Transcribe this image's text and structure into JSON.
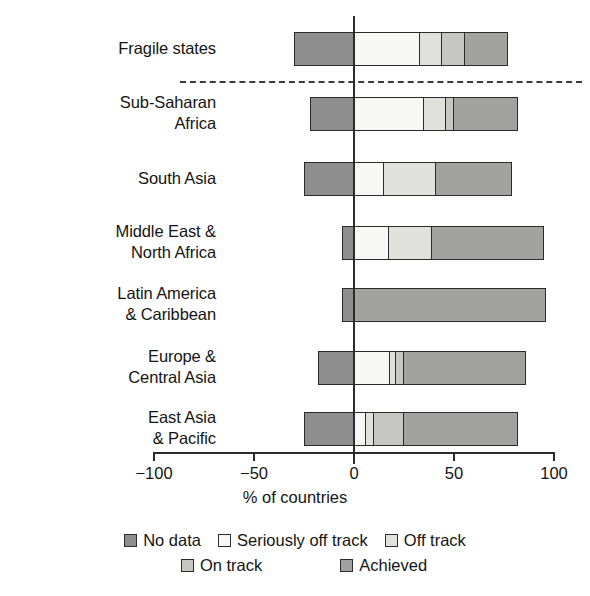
{
  "chart_data": {
    "type": "bar",
    "orientation": "horizontal",
    "stacked": true,
    "diverging": true,
    "title": "",
    "xlabel": "% of countries",
    "ylabel": "",
    "xlim": [
      -100,
      100
    ],
    "xticks": [
      -100,
      -50,
      0,
      50,
      100
    ],
    "xtick_labels": [
      "−100",
      "−50",
      "0",
      "50",
      "100"
    ],
    "grid": false,
    "legend_position": "bottom",
    "categories": [
      "Fragile states",
      "Sub-Saharan\nAfrica",
      "South Asia",
      "Middle East &\nNorth Africa",
      "Latin America\n& Caribbean",
      "Europe &\nCentral Asia",
      "East Asia\n& Pacific"
    ],
    "series": [
      {
        "name": "No data",
        "color": "#8e8e8e",
        "values": [
          -30,
          -22,
          -25,
          -6,
          -6,
          -18,
          -25
        ]
      },
      {
        "name": "Seriously off track",
        "color": "#f7f7f5",
        "values": [
          33,
          35,
          15,
          17,
          0,
          18,
          6
        ]
      },
      {
        "name": "Off track",
        "color": "#e0e0dd",
        "values": [
          11,
          11,
          26,
          22,
          0,
          3,
          4
        ]
      },
      {
        "name": "On track",
        "color": "#c6c6c2",
        "values": [
          12,
          4,
          0,
          0,
          0,
          4,
          15
        ]
      },
      {
        "name": "Achieved",
        "color": "#a2a2a0",
        "values": [
          21,
          32,
          38,
          56,
          96,
          61,
          57
        ]
      }
    ],
    "annotations": [
      {
        "type": "dashed-separator",
        "after_category": "Fragile states"
      }
    ]
  },
  "legend": {
    "rows": [
      [
        {
          "label": "No data",
          "color": "#8e8e8e"
        },
        {
          "label": "Seriously off track",
          "color": "#f7f7f5"
        },
        {
          "label": "Off track",
          "color": "#e0e0dd"
        }
      ],
      [
        {
          "label": "On track",
          "color": "#c6c6c2"
        },
        {
          "label": "Achieved",
          "color": "#a2a2a0"
        }
      ]
    ]
  },
  "geometry": {
    "zero_x": 354,
    "px_per_unit": 2,
    "bar_height": 34,
    "bar_tops": [
      32,
      97,
      162,
      226,
      288,
      351,
      412
    ],
    "label_tops": [
      38,
      92,
      168,
      221,
      283,
      346,
      407
    ],
    "divider_y": 81,
    "axis_left": 154,
    "axis_right": 554
  }
}
